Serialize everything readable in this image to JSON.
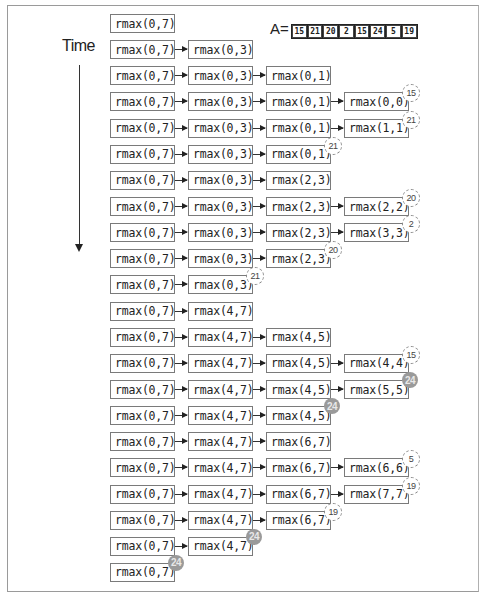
{
  "diagram": {
    "title_label": "Time",
    "array": {
      "label": "A=",
      "values": [
        "15",
        "21",
        "20",
        "2",
        "15",
        "24",
        "5",
        "19"
      ]
    },
    "colors": {
      "box_border": "#7a7a7a",
      "badge_max_fill": "#9a9a9a",
      "text": "#222222"
    },
    "rows": [
      {
        "stack": [
          "rmax(0,7)"
        ]
      },
      {
        "stack": [
          "rmax(0,7)",
          "rmax(0,3)"
        ]
      },
      {
        "stack": [
          "rmax(0,7)",
          "rmax(0,3)",
          "rmax(0,1)"
        ]
      },
      {
        "stack": [
          "rmax(0,7)",
          "rmax(0,3)",
          "rmax(0,1)",
          "rmax(0,0)"
        ],
        "returns": "15",
        "style": "ret"
      },
      {
        "stack": [
          "rmax(0,7)",
          "rmax(0,3)",
          "rmax(0,1)",
          "rmax(1,1)"
        ],
        "returns": "21",
        "style": "ret"
      },
      {
        "stack": [
          "rmax(0,7)",
          "rmax(0,3)",
          "rmax(0,1)"
        ],
        "returns": "21",
        "style": "ret"
      },
      {
        "stack": [
          "rmax(0,7)",
          "rmax(0,3)",
          "rmax(2,3)"
        ]
      },
      {
        "stack": [
          "rmax(0,7)",
          "rmax(0,3)",
          "rmax(2,3)",
          "rmax(2,2)"
        ],
        "returns": "20",
        "style": "ret"
      },
      {
        "stack": [
          "rmax(0,7)",
          "rmax(0,3)",
          "rmax(2,3)",
          "rmax(3,3)"
        ],
        "returns": "2",
        "style": "ret"
      },
      {
        "stack": [
          "rmax(0,7)",
          "rmax(0,3)",
          "rmax(2,3)"
        ],
        "returns": "20",
        "style": "ret"
      },
      {
        "stack": [
          "rmax(0,7)",
          "rmax(0,3)"
        ],
        "returns": "21",
        "style": "ret"
      },
      {
        "stack": [
          "rmax(0,7)",
          "rmax(4,7)"
        ]
      },
      {
        "stack": [
          "rmax(0,7)",
          "rmax(4,7)",
          "rmax(4,5)"
        ]
      },
      {
        "stack": [
          "rmax(0,7)",
          "rmax(4,7)",
          "rmax(4,5)",
          "rmax(4,4)"
        ],
        "returns": "15",
        "style": "ret"
      },
      {
        "stack": [
          "rmax(0,7)",
          "rmax(4,7)",
          "rmax(4,5)",
          "rmax(5,5)"
        ],
        "returns": "24",
        "style": "max"
      },
      {
        "stack": [
          "rmax(0,7)",
          "rmax(4,7)",
          "rmax(4,5)"
        ],
        "returns": "24",
        "style": "max"
      },
      {
        "stack": [
          "rmax(0,7)",
          "rmax(4,7)",
          "rmax(6,7)"
        ]
      },
      {
        "stack": [
          "rmax(0,7)",
          "rmax(4,7)",
          "rmax(6,7)",
          "rmax(6,6)"
        ],
        "returns": "5",
        "style": "ret"
      },
      {
        "stack": [
          "rmax(0,7)",
          "rmax(4,7)",
          "rmax(6,7)",
          "rmax(7,7)"
        ],
        "returns": "19",
        "style": "ret"
      },
      {
        "stack": [
          "rmax(0,7)",
          "rmax(4,7)",
          "rmax(6,7)"
        ],
        "returns": "19",
        "style": "ret"
      },
      {
        "stack": [
          "rmax(0,7)",
          "rmax(4,7)"
        ],
        "returns": "24",
        "style": "max"
      },
      {
        "stack": [
          "rmax(0,7)"
        ],
        "returns": "24",
        "style": "max"
      }
    ]
  }
}
